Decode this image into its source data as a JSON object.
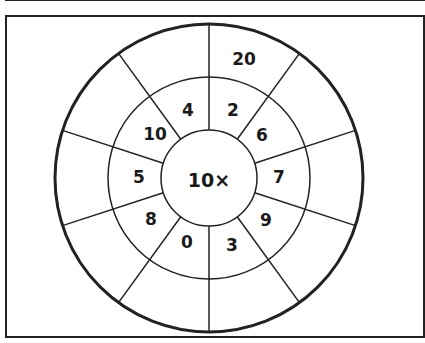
{
  "diagram": {
    "type": "multiplication-wheel",
    "center_label": "10×",
    "center_operation": "multiply by 10",
    "inner_ring_labels_clockwise_from_top": [
      "2",
      "6",
      "7",
      "9",
      "3",
      "0",
      "8",
      "5",
      "10",
      "4"
    ],
    "outer_ring_labels_clockwise_from_top": [
      "20",
      "",
      "",
      "",
      "",
      "",
      "",
      "",
      "",
      ""
    ],
    "segments": 10,
    "colors": {
      "stroke": "#222222",
      "text": "#1a1a1a",
      "background": "#ffffff"
    }
  }
}
